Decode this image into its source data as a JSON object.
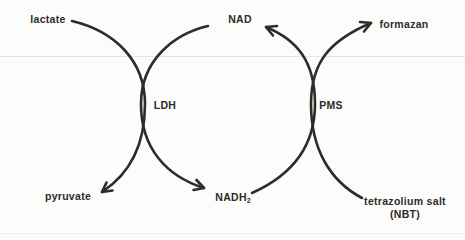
{
  "diagram": {
    "kind": "coupled-enzyme-reaction-scheme",
    "nodes": {
      "lactate": {
        "label": "lactate"
      },
      "nad": {
        "label": "NAD"
      },
      "formazan": {
        "label": "formazan"
      },
      "ldh": {
        "label": "LDH"
      },
      "pms": {
        "label": "PMS"
      },
      "pyruvate": {
        "label": "pyruvate"
      },
      "nadh2": {
        "label": "NADH",
        "subscript": "2"
      },
      "tetrazolium": {
        "label_line1": "tetrazolium salt",
        "label_line2": "(NBT)"
      }
    },
    "reactions": [
      {
        "from": "lactate",
        "to": "pyruvate",
        "catalyst": "LDH"
      },
      {
        "from": "NAD",
        "to": "NADH2",
        "catalyst": "LDH"
      },
      {
        "from": "NADH2",
        "to": "NAD",
        "catalyst": "PMS"
      },
      {
        "from": "tetrazolium salt (NBT)",
        "to": "formazan",
        "catalyst": "PMS"
      }
    ],
    "colors": {
      "stroke": "#2c2c2c",
      "background": "#fcfcfb",
      "rule_line_top": "#ece2e1",
      "rule_line_bottom": "#f2eceb"
    }
  }
}
